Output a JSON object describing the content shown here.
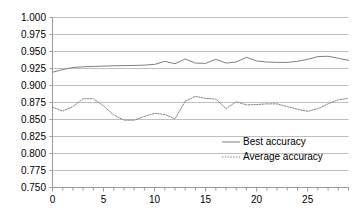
{
  "chart_data": {
    "type": "line",
    "title": "",
    "subtitle": "",
    "xlabel": "",
    "ylabel": "",
    "xlim": [
      0,
      29
    ],
    "ylim": [
      0.75,
      1.0
    ],
    "grid": true,
    "grid_axis": "y",
    "legend_position": "center-right-inside",
    "x_ticks": [
      0,
      5,
      10,
      15,
      20,
      25
    ],
    "x_tick_labels": [
      "0",
      "5",
      "10",
      "15",
      "20",
      "25"
    ],
    "x_minor_tick_interval": 1,
    "y_ticks": [
      0.75,
      0.775,
      0.8,
      0.825,
      0.85,
      0.875,
      0.9,
      0.925,
      0.95,
      0.975,
      1.0
    ],
    "y_tick_labels": [
      "0.750",
      "0.775",
      "0.800",
      "0.825",
      "0.850",
      "0.875",
      "0.900",
      "0.925",
      "0.950",
      "0.975",
      "1.000"
    ],
    "x": [
      0,
      1,
      2,
      3,
      4,
      5,
      6,
      7,
      8,
      9,
      10,
      11,
      12,
      13,
      14,
      15,
      16,
      17,
      18,
      19,
      20,
      21,
      22,
      23,
      24,
      25,
      26,
      27,
      28,
      29
    ],
    "series": [
      {
        "name": "Best accuracy",
        "style": "solid",
        "color": "#808080",
        "values": [
          0.9195,
          0.9235,
          0.9265,
          0.9275,
          0.928,
          0.9285,
          0.929,
          0.9292,
          0.9295,
          0.93,
          0.931,
          0.9355,
          0.932,
          0.939,
          0.933,
          0.9325,
          0.9385,
          0.933,
          0.9345,
          0.9415,
          0.936,
          0.9345,
          0.934,
          0.934,
          0.9355,
          0.9385,
          0.9425,
          0.943,
          0.94,
          0.937
        ]
      },
      {
        "name": "Average accuracy",
        "style": "dotted",
        "color": "#808080",
        "values": [
          0.868,
          0.8625,
          0.869,
          0.8805,
          0.8805,
          0.87,
          0.8565,
          0.849,
          0.849,
          0.8545,
          0.859,
          0.8575,
          0.851,
          0.877,
          0.884,
          0.881,
          0.88,
          0.866,
          0.876,
          0.8715,
          0.872,
          0.873,
          0.873,
          0.869,
          0.865,
          0.862,
          0.866,
          0.873,
          0.879,
          0.881
        ]
      }
    ]
  },
  "legend": {
    "items": [
      {
        "label": "Best accuracy",
        "style": "solid"
      },
      {
        "label": "Average accuracy",
        "style": "dotted"
      }
    ]
  }
}
